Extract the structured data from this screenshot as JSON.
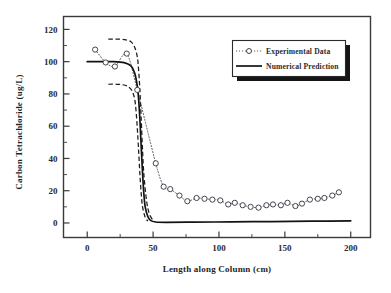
{
  "chart_data": {
    "type": "line",
    "title": "",
    "xlabel": "Length along Column (cm)",
    "ylabel": "Carbon Tetrachloride (ug/L)",
    "xlim": [
      -18,
      215
    ],
    "ylim": [
      -9,
      128
    ],
    "grid": false,
    "legend_position": "top-right",
    "xticks": [
      0,
      50,
      100,
      150,
      200
    ],
    "xtick_labels": [
      "0",
      "50",
      "100",
      "150",
      "200"
    ],
    "xminor_ticks": [
      25,
      75,
      125,
      175
    ],
    "yticks": [
      0,
      20,
      40,
      60,
      80,
      100,
      120
    ],
    "ytick_labels": [
      "0",
      "20",
      "40",
      "60",
      "80",
      "100",
      "120"
    ],
    "yminor_ticks": [
      10,
      30,
      50,
      70,
      90,
      110
    ],
    "series": [
      {
        "name": "Experimental Data",
        "style": "dotted-with-open-circle-markers",
        "marker": "open-circle",
        "color": "#50505a",
        "x": [
          6,
          14,
          21,
          30,
          38,
          52,
          58,
          63,
          70,
          76,
          83,
          89,
          95,
          101,
          107,
          112,
          118,
          124,
          130,
          136,
          141,
          147,
          152,
          158,
          163,
          169,
          175,
          180,
          186,
          191
        ],
        "y": [
          107.5,
          99.5,
          97.0,
          105.0,
          82.5,
          37.0,
          22.5,
          21.0,
          17.0,
          13.5,
          15.5,
          15.0,
          14.5,
          14.0,
          11.5,
          12.5,
          11.0,
          10.0,
          9.5,
          11.0,
          11.5,
          11.0,
          12.5,
          10.5,
          12.0,
          14.5,
          15.0,
          15.5,
          17.0,
          19.0
        ]
      },
      {
        "name": "Numerical Prediction",
        "style": "solid",
        "color": "#121212",
        "x": [
          0,
          10,
          20,
          28,
          33,
          36,
          38,
          39,
          40,
          41,
          42,
          43,
          44,
          46,
          48,
          52,
          60,
          80,
          110,
          140,
          170,
          200
        ],
        "y": [
          100,
          100,
          100,
          99.4,
          97.5,
          93.0,
          85.0,
          77.0,
          64.0,
          47.0,
          31.0,
          18.0,
          10.0,
          4.0,
          1.6,
          0.6,
          0.4,
          0.5,
          0.7,
          0.9,
          1.1,
          1.3
        ]
      },
      {
        "name": "Upper Confidence Band",
        "style": "dashed",
        "color": "#1c1c1c",
        "x": [
          16,
          22,
          28,
          33,
          36,
          38,
          39,
          40,
          41,
          42,
          43,
          45,
          47,
          50
        ],
        "y": [
          114.0,
          114.0,
          113.7,
          112.5,
          109.0,
          103.0,
          95.0,
          82.0,
          64.0,
          45.0,
          30.0,
          14.0,
          6.0,
          1.5
        ]
      },
      {
        "name": "Lower Confidence Band",
        "style": "dashed",
        "color": "#1c1c1c",
        "x": [
          16,
          22,
          27,
          31,
          34,
          36,
          37,
          38,
          39,
          40,
          41,
          42,
          44,
          46
        ],
        "y": [
          86.0,
          86.0,
          85.7,
          84.6,
          82.0,
          77.0,
          70.0,
          59.0,
          45.0,
          30.0,
          18.0,
          10.0,
          3.5,
          1.2
        ]
      }
    ]
  },
  "legend": {
    "entries": [
      {
        "label": "Experimental Data",
        "marker": "open-circle-dotted"
      },
      {
        "label": "Numerical Prediction",
        "marker": "solid-line"
      }
    ]
  },
  "axes": {
    "x_title": "Length along Column (cm)",
    "y_title": "Carbon Tetrachloride (ug/L)"
  },
  "colors": {
    "frame": "#3a3a3a",
    "prediction": "#121212",
    "band": "#1c1c1c",
    "experimental": "#50505a",
    "marker_fill": "#ffffff",
    "background": "#ffffff"
  }
}
